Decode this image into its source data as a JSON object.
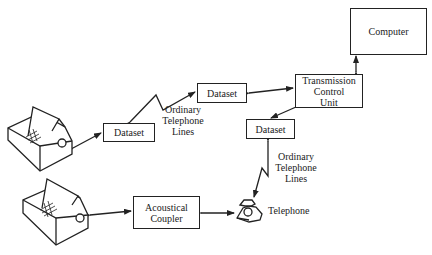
{
  "diagram": {
    "nodes": {
      "computer": "Computer",
      "tcu_line1": "Transmission",
      "tcu_line2": "Control",
      "tcu_line3": "Unit",
      "dataset_top": "Dataset",
      "dataset_left": "Dataset",
      "dataset_right": "Dataset",
      "acoustical_line1": "Acoustical",
      "acoustical_line2": "Coupler",
      "telephone": "Telephone"
    },
    "labels": {
      "lines_upper": [
        "Ordinary",
        "Telephone",
        "Lines"
      ],
      "lines_lower": [
        "Ordinary",
        "Telephone",
        "Lines"
      ]
    },
    "terminals": [
      "terminal-upper",
      "terminal-lower"
    ],
    "edges": [
      [
        "terminal-upper",
        "dataset_left"
      ],
      [
        "dataset_left",
        "dataset_top",
        "Ordinary Telephone Lines"
      ],
      [
        "dataset_top",
        "tcu"
      ],
      [
        "tcu",
        "computer"
      ],
      [
        "tcu",
        "dataset_right"
      ],
      [
        "dataset_right",
        "telephone",
        "Ordinary Telephone Lines"
      ],
      [
        "terminal-lower",
        "acoustical_coupler"
      ],
      [
        "acoustical_coupler",
        "telephone"
      ]
    ]
  }
}
